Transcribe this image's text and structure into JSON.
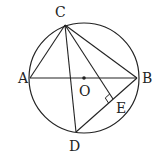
{
  "diagram": {
    "type": "circle-geometry",
    "stroke_color": "#222222",
    "background": "#ffffff",
    "circle": {
      "center": "O",
      "cx": 84,
      "cy": 78,
      "r": 55
    },
    "points": {
      "A": {
        "x": 30,
        "y": 78,
        "label": "A",
        "lx": 18,
        "ly": 83
      },
      "B": {
        "x": 137,
        "y": 78,
        "label": "B",
        "lx": 142,
        "ly": 83
      },
      "C": {
        "x": 65,
        "y": 25,
        "label": "C",
        "lx": 55,
        "ly": 17
      },
      "D": {
        "x": 76,
        "y": 132,
        "label": "D",
        "lx": 69,
        "ly": 151
      },
      "O": {
        "x": 84,
        "y": 78,
        "label": "O",
        "lx": 79,
        "ly": 96
      },
      "E": {
        "x": 113,
        "y": 99,
        "label": "E",
        "lx": 116,
        "ly": 113
      }
    },
    "segments": [
      [
        "A",
        "B"
      ],
      [
        "A",
        "C"
      ],
      [
        "C",
        "B"
      ],
      [
        "C",
        "D"
      ],
      [
        "C",
        "E"
      ],
      [
        "B",
        "D"
      ]
    ],
    "right_angle_at": "E",
    "relations": [
      "AB is a diameter of circle O",
      "CE ⊥ BD at E"
    ]
  }
}
